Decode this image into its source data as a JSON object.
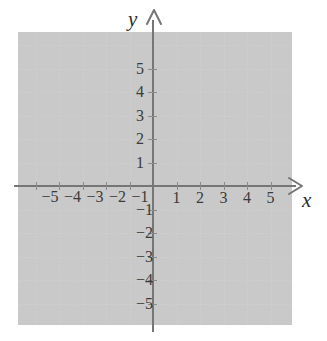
{
  "chart_data": {
    "type": "scatter",
    "title": "",
    "subtitle": "",
    "xlabel": "x",
    "ylabel": "y",
    "xlim": [
      -6,
      6
    ],
    "ylim": [
      -6,
      6
    ],
    "grid": true,
    "legend": null,
    "series": [
      {
        "name": "empty",
        "x": [],
        "y": []
      }
    ],
    "x_ticks": [
      -5,
      -4,
      -3,
      -2,
      -1,
      1,
      2,
      3,
      4,
      5
    ],
    "y_ticks": [
      5,
      4,
      3,
      2,
      1,
      -1,
      -2,
      -3,
      -4,
      -5
    ],
    "x_tick_labels": [
      "−5",
      "−4",
      "−3",
      "−2",
      "−1",
      "1",
      "2",
      "3",
      "4",
      "5"
    ],
    "y_tick_labels": [
      "5",
      "4",
      "3",
      "2",
      "1",
      "−1",
      "−2",
      "−3",
      "−4",
      "−5"
    ],
    "annotations": [],
    "data_points": [],
    "colors": {
      "background": "#ffffff",
      "grid": "#cfcfcf",
      "axis": "#767676",
      "tick_label": "#3b3b3b",
      "axis_label": "#2e2e2e"
    }
  },
  "axes": {
    "y_label": "y",
    "x_label": "x",
    "y_arrow_icon": "arrow-up-icon",
    "x_arrow_icon": "arrow-right-icon"
  },
  "x_labels": {
    "neg": [
      {
        "value": -5,
        "text": "−5"
      },
      {
        "value": -4,
        "text": "−4"
      },
      {
        "value": -3,
        "text": "−3"
      },
      {
        "value": -2,
        "text": "−2"
      },
      {
        "value": -1,
        "text": "−1"
      }
    ],
    "pos": [
      {
        "value": 1,
        "text": "1"
      },
      {
        "value": 2,
        "text": "2"
      },
      {
        "value": 3,
        "text": "3"
      },
      {
        "value": 4,
        "text": "4"
      },
      {
        "value": 5,
        "text": "5"
      }
    ]
  },
  "y_labels": {
    "pos": [
      {
        "value": 5,
        "text": "5"
      },
      {
        "value": 4,
        "text": "4"
      },
      {
        "value": 3,
        "text": "3"
      },
      {
        "value": 2,
        "text": "2"
      },
      {
        "value": 1,
        "text": "1"
      }
    ],
    "neg": [
      {
        "value": -1,
        "text": "−1"
      },
      {
        "value": -2,
        "text": "−2"
      },
      {
        "value": -3,
        "text": "−3"
      },
      {
        "value": -4,
        "text": "−4"
      },
      {
        "value": -5,
        "text": "−5"
      }
    ]
  }
}
